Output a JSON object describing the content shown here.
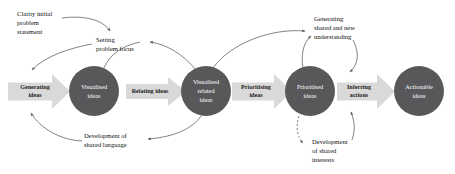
{
  "diagram": {
    "colors": {
      "node_fill": "#58585a",
      "node_text": "#ffffff",
      "arrow_fill": "#d9d9d9",
      "curve_stroke": "#5a5a5c",
      "background": "#ffffff"
    },
    "nodes": [
      {
        "id": "visualised-ideas",
        "lines": [
          "Visualised",
          "ideas"
        ],
        "cx": 94,
        "cy": 91,
        "r": 25
      },
      {
        "id": "visualised-related-ideas",
        "lines": [
          "Visualised",
          "related",
          "ideas"
        ],
        "cx": 206,
        "cy": 91,
        "r": 25
      },
      {
        "id": "prioritised-ideas",
        "lines": [
          "Prioritised",
          "ideas"
        ],
        "cx": 310,
        "cy": 91,
        "r": 25
      },
      {
        "id": "actionable-ideas",
        "lines": [
          "Actionable",
          "ideas"
        ],
        "cx": 419,
        "cy": 91,
        "r": 25
      }
    ],
    "process_arrows": [
      {
        "id": "generating-ideas",
        "lines": [
          "Generating",
          "ideas"
        ],
        "x": 8,
        "y": 74,
        "w": 62,
        "h": 35
      },
      {
        "id": "relating-ideas",
        "lines": [
          "Relating ideas"
        ],
        "x": 126,
        "y": 77,
        "w": 60,
        "h": 29
      },
      {
        "id": "prioritising-ideas",
        "lines": [
          "Prioritising",
          "ideas"
        ],
        "x": 232,
        "y": 74,
        "w": 60,
        "h": 34
      },
      {
        "id": "inferring-actions",
        "lines": [
          "Inferring",
          "actions"
        ],
        "x": 337,
        "y": 74,
        "w": 58,
        "h": 34
      }
    ],
    "annotations": [
      {
        "id": "clarity-initial-problem-statement",
        "lines": [
          "Clarity initial",
          "problem",
          "statement"
        ],
        "x": 17,
        "y": 14,
        "align": "start"
      },
      {
        "id": "setting-problem-focus",
        "lines": [
          "Setting",
          "problem focus"
        ],
        "x": 96,
        "y": 40,
        "align": "start"
      },
      {
        "id": "generating-shared-and-new-understanding",
        "lines": [
          "Generating",
          "shared and new",
          "understanding"
        ],
        "x": 314,
        "y": 19,
        "align": "start"
      },
      {
        "id": "development-of-shared-language",
        "lines": [
          "Development of",
          "shared language"
        ],
        "x": 84,
        "y": 136,
        "align": "start"
      },
      {
        "id": "development-of-shared-interests",
        "lines": [
          "Development",
          "of shared",
          "interests"
        ],
        "x": 312,
        "y": 142,
        "align": "start"
      }
    ]
  }
}
